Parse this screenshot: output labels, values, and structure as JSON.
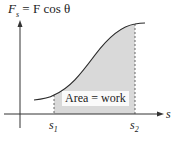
{
  "title": {
    "lhs_main": "F",
    "lhs_sub": "s",
    "eq": " = ",
    "rhs": "F cos θ"
  },
  "axes": {
    "x_label": "s",
    "s1_main": "s",
    "s1_sub": "1",
    "s2_main": "s",
    "s2_sub": "2"
  },
  "area_label": "Area = work",
  "colors": {
    "shade": "#d6d6d6",
    "curve": "#2a2a2a",
    "axis": "#333333"
  }
}
